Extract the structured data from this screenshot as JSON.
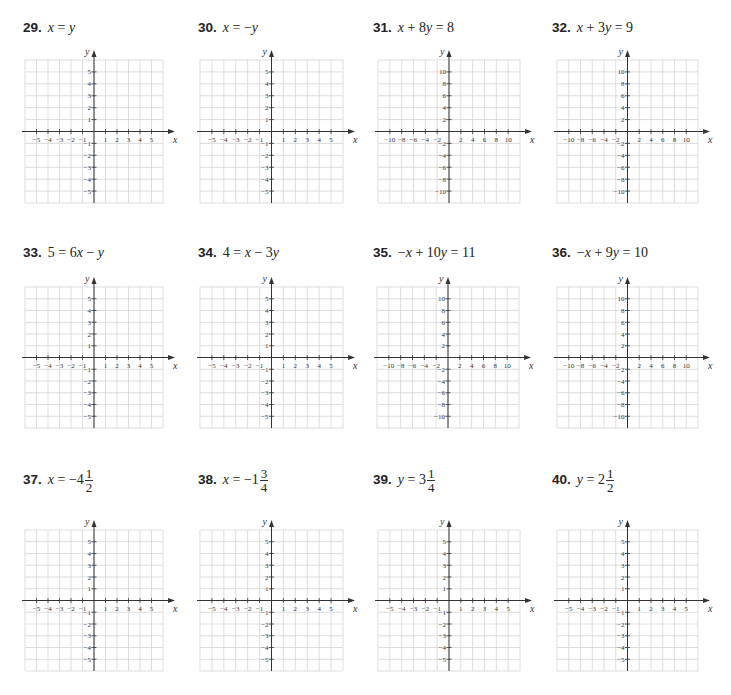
{
  "page": {
    "background": "#ffffff",
    "grid_color": "#d4d4d4",
    "axis_color": "#333333"
  },
  "axis_templates": {
    "small": {
      "range": [
        -6,
        6
      ],
      "tick_step": 1,
      "labels": [
        "-5",
        "-4",
        "-3",
        "-2",
        "-1",
        "1",
        "2",
        "3",
        "4",
        "5"
      ],
      "label_values": [
        -5,
        -4,
        -3,
        -2,
        -1,
        1,
        2,
        3,
        4,
        5
      ],
      "x_axis_label": "x",
      "y_axis_label": "y"
    },
    "large": {
      "range": [
        -12,
        12
      ],
      "tick_step": 2,
      "labels": [
        "-10",
        "-8",
        "-6",
        "-4",
        "-2",
        "2",
        "4",
        "6",
        "8",
        "10"
      ],
      "label_values": [
        -10,
        -8,
        -6,
        -4,
        -2,
        2,
        4,
        6,
        8,
        10
      ],
      "x_axis_label": "x",
      "y_axis_label": "y"
    }
  },
  "problems": [
    {
      "number": "29.",
      "equation_parts": [
        [
          "i",
          "x"
        ],
        [
          "t",
          " = "
        ],
        [
          "i",
          "y"
        ]
      ],
      "scale": "small",
      "label_pos": [
        23,
        20
      ],
      "grid": [
        25,
        60,
        138,
        143
      ]
    },
    {
      "number": "30.",
      "equation_parts": [
        [
          "i",
          "x"
        ],
        [
          "t",
          " = −"
        ],
        [
          "i",
          "y"
        ]
      ],
      "scale": "small",
      "label_pos": [
        198,
        20
      ],
      "grid": [
        200,
        60,
        143,
        143
      ]
    },
    {
      "number": "31.",
      "equation_parts": [
        [
          "i",
          "x"
        ],
        [
          "t",
          " + 8"
        ],
        [
          "i",
          "y"
        ],
        [
          "t",
          " = 8"
        ]
      ],
      "scale": "large",
      "label_pos": [
        373,
        20
      ],
      "grid": [
        378,
        60,
        142,
        143
      ]
    },
    {
      "number": "32.",
      "equation_parts": [
        [
          "i",
          "x"
        ],
        [
          "t",
          " + 3"
        ],
        [
          "i",
          "y"
        ],
        [
          "t",
          " = 9"
        ]
      ],
      "scale": "large",
      "label_pos": [
        552,
        20
      ],
      "grid": [
        557,
        60,
        141,
        143
      ]
    },
    {
      "number": "33.",
      "equation_parts": [
        [
          "t",
          "5 = 6"
        ],
        [
          "i",
          "x"
        ],
        [
          "t",
          " − "
        ],
        [
          "i",
          "y"
        ]
      ],
      "scale": "small",
      "label_pos": [
        23,
        245
      ],
      "grid": [
        25,
        287,
        138,
        141
      ]
    },
    {
      "number": "34.",
      "equation_parts": [
        [
          "t",
          "4 = "
        ],
        [
          "i",
          "x"
        ],
        [
          "t",
          " − 3"
        ],
        [
          "i",
          "y"
        ]
      ],
      "scale": "small",
      "label_pos": [
        198,
        245
      ],
      "grid": [
        200,
        287,
        143,
        141
      ]
    },
    {
      "number": "35.",
      "equation_parts": [
        [
          "t",
          "−"
        ],
        [
          "i",
          "x"
        ],
        [
          "t",
          " + 10"
        ],
        [
          "i",
          "y"
        ],
        [
          "t",
          " = 11"
        ]
      ],
      "scale": "large",
      "label_pos": [
        373,
        245
      ],
      "grid": [
        377,
        287,
        142,
        141
      ]
    },
    {
      "number": "36.",
      "equation_parts": [
        [
          "t",
          "−"
        ],
        [
          "i",
          "x"
        ],
        [
          "t",
          " + 9"
        ],
        [
          "i",
          "y"
        ],
        [
          "t",
          " = 10"
        ]
      ],
      "scale": "large",
      "label_pos": [
        552,
        245
      ],
      "grid": [
        557,
        287,
        141,
        141
      ]
    },
    {
      "number": "37.",
      "equation_parts": [
        [
          "i",
          "x"
        ],
        [
          "t",
          " = −4"
        ]
      ],
      "fraction": {
        "numerator": "1",
        "denominator": "2"
      },
      "scale": "small",
      "label_pos": [
        23,
        467
      ],
      "grid": [
        25,
        530,
        138,
        141
      ]
    },
    {
      "number": "38.",
      "equation_parts": [
        [
          "i",
          "x"
        ],
        [
          "t",
          " = −1"
        ]
      ],
      "fraction": {
        "numerator": "3",
        "denominator": "4"
      },
      "scale": "small",
      "label_pos": [
        198,
        467
      ],
      "grid": [
        200,
        530,
        143,
        141
      ]
    },
    {
      "number": "39.",
      "equation_parts": [
        [
          "i",
          "y"
        ],
        [
          "t",
          " = 3"
        ]
      ],
      "fraction": {
        "numerator": "1",
        "denominator": "4"
      },
      "scale": "small",
      "label_pos": [
        373,
        467
      ],
      "grid": [
        378,
        530,
        142,
        141
      ]
    },
    {
      "number": "40.",
      "equation_parts": [
        [
          "i",
          "y"
        ],
        [
          "t",
          " = 2"
        ]
      ],
      "fraction": {
        "numerator": "1",
        "denominator": "2"
      },
      "scale": "small",
      "label_pos": [
        552,
        467
      ],
      "grid": [
        557,
        530,
        141,
        141
      ]
    }
  ]
}
